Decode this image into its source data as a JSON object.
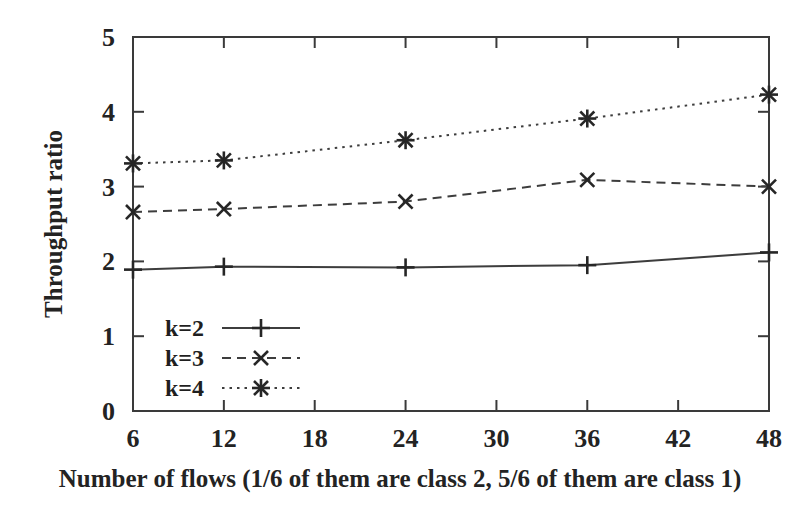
{
  "chart_data": {
    "type": "line",
    "title": "",
    "xlabel": "Number of flows (1/6 of them are class 2, 5/6 of them are class 1)",
    "ylabel": "Throughput ratio",
    "x": [
      6,
      12,
      24,
      36,
      48
    ],
    "xlim": [
      6,
      48
    ],
    "ylim": [
      0,
      5
    ],
    "xticks": [
      6,
      12,
      18,
      24,
      30,
      36,
      42,
      48
    ],
    "xtick_labels": [
      "6",
      "12",
      "18",
      "24",
      "30",
      "36",
      "42",
      "48"
    ],
    "yticks": [
      0,
      1,
      2,
      3,
      4,
      5
    ],
    "ytick_labels": [
      "0",
      "1",
      "2",
      "3",
      "4",
      "5"
    ],
    "grid": false,
    "legend_position": "lower-left-inside",
    "series": [
      {
        "name": "k=2",
        "label": "k=2",
        "linestyle": "solid",
        "marker": "plus",
        "color": "#3d3d3d",
        "values": [
          1.89,
          1.93,
          1.92,
          1.95,
          2.12
        ]
      },
      {
        "name": "k=3",
        "label": "k=3",
        "linestyle": "dashed",
        "marker": "cross",
        "color": "#3d3d3d",
        "values": [
          2.66,
          2.7,
          2.8,
          3.09,
          3.0
        ]
      },
      {
        "name": "k=4",
        "label": "k=4",
        "linestyle": "dotted",
        "marker": "asterisk",
        "color": "#3d3d3d",
        "values": [
          3.31,
          3.35,
          3.62,
          3.91,
          4.23
        ]
      }
    ]
  },
  "figure": {
    "background_color": "#ffffff",
    "axis_color": "#3a3a3a",
    "text_color": "#232323"
  }
}
